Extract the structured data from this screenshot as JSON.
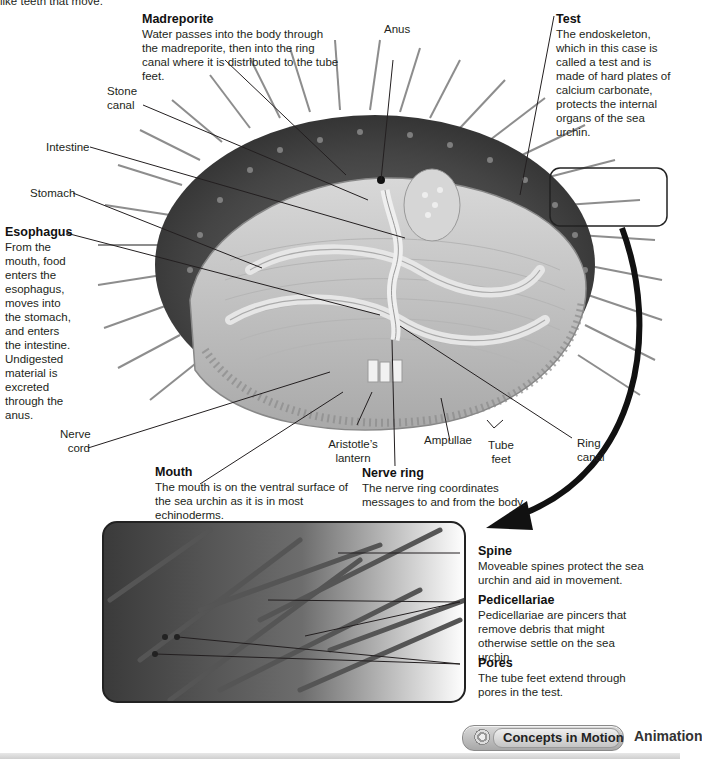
{
  "intro_fragment": "like teeth that move.",
  "labels": {
    "madreporite": {
      "title": "Madreporite",
      "body": "Water passes into the body through the madreporite, then into the ring canal where it is distributed to the tube feet."
    },
    "anus": "Anus",
    "test": {
      "title": "Test",
      "body": "The endoskeleton, which in this case is called a test and is made of hard plates of calcium carbonate, protects the internal organs of the sea urchin."
    },
    "stone_canal": "Stone canal",
    "intestine": "Intestine",
    "stomach": "Stomach",
    "esophagus": {
      "title": "Esophagus",
      "body": "From the mouth, food enters the esophagus, moves into the stomach, and enters the intestine. Undigested material is excreted through the anus."
    },
    "nerve_cord": "Nerve cord",
    "aristotles_lantern": "Aristotle’s lantern",
    "ampullae": "Ampullae",
    "tube_feet": "Tube feet",
    "ring_canal": "Ring canal",
    "mouth": {
      "title": "Mouth",
      "body": "The mouth is on the ventral surface of the sea urchin as it is in most echinoderms."
    },
    "nerve_ring": {
      "title": "Nerve ring",
      "body": "The nerve ring coordinates messages to and from the body."
    },
    "spine": {
      "title": "Spine",
      "body": "Moveable spines protect the sea urchin and aid in movement."
    },
    "pedicellariae": {
      "title": "Pedicellariae",
      "body": "Pedicellariae are pincers that remove debris that might otherwise settle on the sea urchin."
    },
    "pores": {
      "title": "Pores",
      "body": "The tube feet extend through pores in the test."
    }
  },
  "footer": {
    "button_label": "Concepts in Motion",
    "button_icon": "concepts-in-motion-icon",
    "link_label": "Animation"
  },
  "colors": {
    "line": "#231f20",
    "test_dark": "#4a4a4a",
    "interior": "#c9c9c9",
    "arrow": "#111111"
  }
}
